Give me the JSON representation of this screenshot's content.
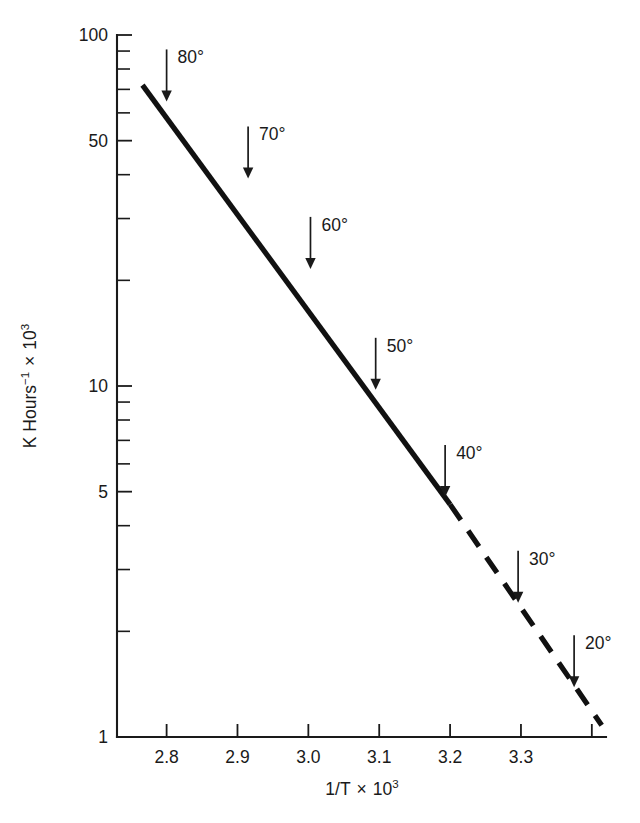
{
  "chart_data": {
    "type": "line",
    "title": "",
    "xlabel": "1/T × 10³",
    "ylabel": "K Hours⁻¹ × 10³",
    "xlabel_parts": {
      "base": "1/T",
      "times": "×",
      "mantissa": "10",
      "exponent": "3"
    },
    "ylabel_parts": {
      "lead": "K Hours",
      "lead_exponent": "−1",
      "times": "×",
      "mantissa": "10",
      "exponent": "3"
    },
    "xscale": "linear",
    "yscale": "log",
    "xlim": [
      2.73,
      3.42
    ],
    "ylim": [
      1,
      100
    ],
    "grid": false,
    "legend": null,
    "xticks": [
      2.8,
      2.9,
      3.0,
      3.1,
      3.2,
      3.3,
      3.4
    ],
    "xticklabels": [
      "2.8",
      "2.9",
      "3.0",
      "3.1",
      "3.2",
      "3.3",
      ""
    ],
    "yticks_major": [
      1,
      5,
      10,
      50,
      100
    ],
    "yticklabels": [
      "1",
      "5",
      "10",
      "50",
      "100"
    ],
    "yticks_minor": [
      2,
      3,
      4,
      6,
      7,
      8,
      9,
      20,
      30,
      40,
      60,
      70,
      80,
      90
    ],
    "series": [
      {
        "name": "Arrhenius fit (measured range)",
        "style": "solid",
        "points": [
          {
            "x": 2.766,
            "y": 72.0
          },
          {
            "x": 3.2,
            "y": 4.6
          }
        ]
      },
      {
        "name": "Arrhenius fit (extrapolated)",
        "style": "dashed",
        "points": [
          {
            "x": 3.2,
            "y": 4.6
          },
          {
            "x": 3.414,
            "y": 1.08
          }
        ]
      }
    ],
    "annotations": [
      {
        "label": "80°",
        "temperature_c": 80,
        "x": 2.8,
        "y_on_line": 63.0
      },
      {
        "label": "70°",
        "temperature_c": 70,
        "x": 2.915,
        "y_on_line": 38.0
      },
      {
        "label": "60°",
        "temperature_c": 60,
        "x": 3.003,
        "y_on_line": 21.0
      },
      {
        "label": "50°",
        "temperature_c": 50,
        "x": 3.095,
        "y_on_line": 9.5
      },
      {
        "label": "40°",
        "temperature_c": 40,
        "x": 3.193,
        "y_on_line": 4.7
      },
      {
        "label": "30°",
        "temperature_c": 30,
        "x": 3.296,
        "y_on_line": 2.35
      },
      {
        "label": "20°",
        "temperature_c": 20,
        "x": 3.375,
        "y_on_line": 1.35
      }
    ]
  }
}
